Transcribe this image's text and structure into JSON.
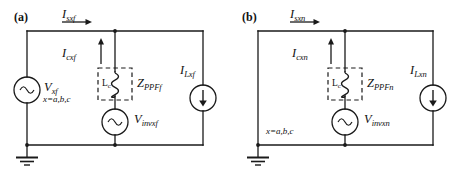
{
  "figure": {
    "type": "circuit-diagram",
    "stroke_color": "#1a1a1a",
    "background_color": "#ffffff"
  },
  "panels": [
    {
      "tag": "(a)",
      "source_current_label": {
        "base": "I",
        "sub": "sxf"
      },
      "branch_current_label": {
        "base": "I",
        "sub": "cxf"
      },
      "load_current_label": {
        "base": "I",
        "sub": "Lxf"
      },
      "source_voltage_label": {
        "base": "V",
        "sub": "xf"
      },
      "phase_note": "x=a,b,c",
      "inductor_label": {
        "base": "L",
        "sub": "c"
      },
      "impedance_label": {
        "base": "Z",
        "sub": "PPFf"
      },
      "inverter_voltage_label": {
        "base": "V",
        "sub": "invxf"
      },
      "ground": "earth-ground"
    },
    {
      "tag": "(b)",
      "source_current_label": {
        "base": "I",
        "sub": "sxn"
      },
      "branch_current_label": {
        "base": "I",
        "sub": "cxn"
      },
      "load_current_label": {
        "base": "I",
        "sub": "Lxn"
      },
      "source_voltage_label": null,
      "phase_note": "x=a,b,c",
      "inductor_label": {
        "base": "L",
        "sub": "c"
      },
      "impedance_label": {
        "base": "Z",
        "sub": "PPFn"
      },
      "inverter_voltage_label": {
        "base": "V",
        "sub": "invxn"
      },
      "ground": "earth-ground"
    }
  ]
}
